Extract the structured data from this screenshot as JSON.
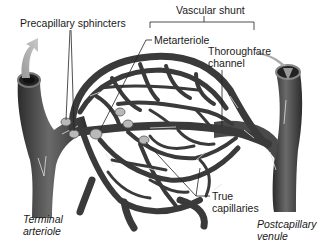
{
  "figure": {
    "type": "capillary-bed-diagram",
    "colors": {
      "vessel": "#3a3a3a",
      "vessel_dark": "#2a2a2a",
      "vessel_highlight": "#6e6e6e",
      "sphincter": "#b8b8b8",
      "arrow_in": "#8a8a8a",
      "leader_line": "#222222",
      "background": "#ffffff"
    },
    "labels": {
      "precapillary_sphincters": "Precapillary sphincters",
      "vascular_shunt": "Vascular shunt",
      "metarteriole": "Metarteriole",
      "thoroughfare_channel_1": "Thoroughfare",
      "thoroughfare_channel_2": "channel",
      "true_capillaries_1": "True",
      "true_capillaries_2": "capillaries",
      "terminal_arteriole_1": "Terminal",
      "terminal_arteriole_2": "arteriole",
      "postcapillary_venule_1": "Postcapillary",
      "postcapillary_venule_2": "venule"
    },
    "structures": [
      {
        "name": "terminal-arteriole",
        "side": "left",
        "flow": "in"
      },
      {
        "name": "postcapillary-venule",
        "side": "right",
        "flow": "out"
      },
      {
        "name": "metarteriole",
        "part_of": "vascular-shunt"
      },
      {
        "name": "thoroughfare-channel",
        "part_of": "vascular-shunt"
      },
      {
        "name": "true-capillaries",
        "count_shown": "network"
      },
      {
        "name": "precapillary-sphincters",
        "count_shown": 6
      }
    ]
  }
}
